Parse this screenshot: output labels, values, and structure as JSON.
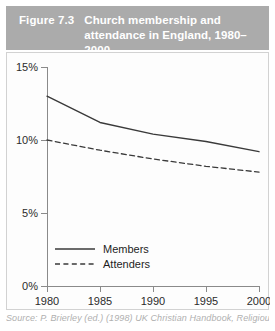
{
  "figure": {
    "number": "Figure 7.3",
    "title": "Church membership and attendance in England, 1980–2000",
    "source": "Source: P. Brierley (ed.) (1998) UK Christian Handbook, Religious Trends"
  },
  "colors": {
    "title_band": "#ababab",
    "title_text": "#ffffff",
    "panel_background": "#fdfdfd",
    "panel_border": "#d2d2d2",
    "axis": "#8a8a8a",
    "series": "#3a3a3a",
    "source_text": "#b0b0b0"
  },
  "chart_data": {
    "type": "line",
    "title": "Church membership and attendance in England, 1980–2000",
    "xlabel": "",
    "ylabel": "",
    "x": [
      1980,
      1985,
      1990,
      1995,
      2000
    ],
    "xtick_labels": [
      "1980",
      "1985",
      "1990",
      "1995",
      "2000"
    ],
    "ytick_values": [
      0,
      5,
      10,
      15
    ],
    "ytick_labels": [
      "0%",
      "5%",
      "10%",
      "15%"
    ],
    "xlim": [
      1980,
      2000
    ],
    "ylim": [
      0,
      15
    ],
    "grid": false,
    "legend_position": "lower-left-inside",
    "series": [
      {
        "name": "Members",
        "style": "solid",
        "values": [
          13.0,
          11.2,
          10.4,
          9.9,
          9.2
        ]
      },
      {
        "name": "Attenders",
        "style": "dashed",
        "values": [
          10.0,
          9.3,
          8.7,
          8.2,
          7.8
        ]
      }
    ]
  },
  "legend": {
    "items": [
      {
        "label": "Members"
      },
      {
        "label": "Attenders"
      }
    ]
  }
}
